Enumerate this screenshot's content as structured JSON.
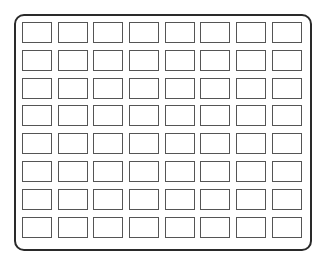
{
  "diagram": {
    "type": "grid",
    "rows": 8,
    "columns": 8,
    "cell_count": 64,
    "colors": {
      "frame_border": "#2a2a2a",
      "cell_border": "#555555",
      "background": "#ffffff"
    }
  }
}
